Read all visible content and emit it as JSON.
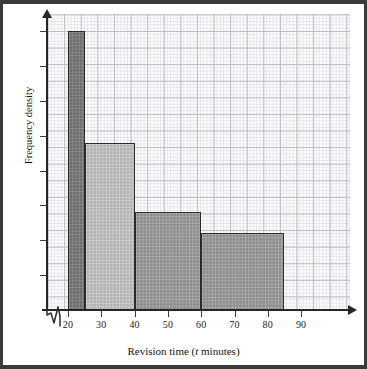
{
  "chart_data": {
    "type": "bar",
    "subtype": "histogram",
    "title": "",
    "xlabel_plain": "Revision time (t minutes)",
    "xlabel_prefix": "Revision time (",
    "xlabel_var": "t",
    "xlabel_suffix": " minutes)",
    "ylabel": "Frequency density",
    "xlim": [
      17,
      93
    ],
    "ylim": [
      0,
      4.4
    ],
    "grid": true,
    "legend": "none",
    "x_ticks": [
      20,
      30,
      40,
      50,
      60,
      70,
      80,
      90
    ],
    "x_tick_labels": [
      "20",
      "30",
      "40",
      "50",
      "60",
      "70",
      "80",
      "90"
    ],
    "y_ticks": [
      0.5,
      1.0,
      1.5,
      2.0,
      2.5,
      3.0,
      3.5,
      4.0
    ],
    "y_tick_labels": [
      "",
      "",
      "",
      "",
      "",
      "",
      "",
      ""
    ],
    "y_axis_has_numeric_labels": false,
    "axis_break_on_x": true,
    "axis_break_between": [
      17,
      20
    ],
    "bins": [
      {
        "label": "20 ≤ t < 25",
        "start": 20,
        "end": 25,
        "width": 5,
        "frequency_density": 4.0,
        "color": "#6e6e6e"
      },
      {
        "label": "25 ≤ t < 40",
        "start": 25,
        "end": 40,
        "width": 15,
        "frequency_density": 2.4,
        "color": "#b2b2b2"
      },
      {
        "label": "40 ≤ t < 60",
        "start": 40,
        "end": 60,
        "width": 20,
        "frequency_density": 1.4,
        "color": "#8d8d8d"
      },
      {
        "label": "60 ≤ t < 85",
        "start": 60,
        "end": 85,
        "width": 25,
        "frequency_density": 1.1,
        "color": "#8d8d8d"
      }
    ],
    "categories": [
      "20-25",
      "25-40",
      "40-60",
      "60-85"
    ],
    "values": [
      4.0,
      2.4,
      1.4,
      1.1
    ]
  },
  "axes": {
    "x_title_prefix": "Revision time (",
    "x_title_var": "t",
    "x_title_suffix": " minutes)",
    "y_title": "Frequency density"
  },
  "ticks": {
    "x": [
      "20",
      "30",
      "40",
      "50",
      "60",
      "70",
      "80",
      "90"
    ]
  },
  "icons": {
    "y_axis_arrow": "arrow-up-icon",
    "x_axis_arrow": "arrow-right-icon",
    "axis_break": "zigzag-break-icon"
  }
}
